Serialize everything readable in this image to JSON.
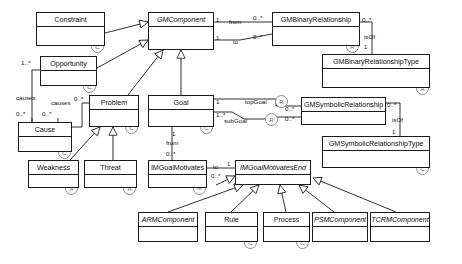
{
  "diagram": {
    "type": "uml-class-diagram",
    "stroke_color": "#1a1a1a",
    "stereotype_color": "#8e8e8e",
    "background": "#ffffff",
    "width": 462,
    "height": 264
  },
  "classes": [
    {
      "id": "constraint",
      "name": "Constraint",
      "abstract": false,
      "stereotype": "C",
      "x": 36,
      "y": 12,
      "w": 69,
      "h": 34
    },
    {
      "id": "gmcomponent",
      "name": "GMComponent",
      "abstract": true,
      "stereotype": "",
      "x": 148,
      "y": 12,
      "w": 66,
      "h": 38
    },
    {
      "id": "gmbinaryrelationship",
      "name": "GMBinaryRelationship",
      "abstract": false,
      "stereotype": "R",
      "x": 272,
      "y": 12,
      "w": 88,
      "h": 34
    },
    {
      "id": "gmbinaryrelationshiptype",
      "name": "GMBinaryRelationshipType",
      "abstract": false,
      "stereotype": "A",
      "x": 322,
      "y": 54,
      "w": 108,
      "h": 34
    },
    {
      "id": "opportunity",
      "name": "Opportunity",
      "abstract": false,
      "stereotype": "C",
      "x": 40,
      "y": 56,
      "w": 57,
      "h": 30
    },
    {
      "id": "problem",
      "name": "Problem",
      "abstract": false,
      "stereotype": "C",
      "x": 89,
      "y": 95,
      "w": 50,
      "h": 32
    },
    {
      "id": "goal",
      "name": "Goal",
      "abstract": false,
      "stereotype": "C",
      "x": 148,
      "y": 95,
      "w": 66,
      "h": 32
    },
    {
      "id": "gmsymbolicrelationship",
      "name": "GMSymbolicRelationship",
      "abstract": false,
      "stereotype": "",
      "x": 301,
      "y": 97,
      "w": 85,
      "h": 28
    },
    {
      "id": "gmsymbolicrelationshiptype",
      "name": "GMSymbolicRelationshipType",
      "abstract": false,
      "stereotype": "C",
      "x": 322,
      "y": 136,
      "w": 108,
      "h": 32
    },
    {
      "id": "cause",
      "name": "Cause",
      "abstract": false,
      "stereotype": "C",
      "x": 18,
      "y": 122,
      "w": 54,
      "h": 30
    },
    {
      "id": "weakness",
      "name": "Weakness",
      "abstract": false,
      "stereotype": "A",
      "x": 28,
      "y": 160,
      "w": 51,
      "h": 28
    },
    {
      "id": "threat",
      "name": "Threat",
      "abstract": false,
      "stereotype": "A",
      "x": 84,
      "y": 160,
      "w": 53,
      "h": 28
    },
    {
      "id": "imgoalmotivates",
      "name": "IMGoalMotivates",
      "abstract": false,
      "stereotype": "IR",
      "x": 148,
      "y": 160,
      "w": 59,
      "h": 28
    },
    {
      "id": "imgoalmotivatesend",
      "name": "IMGoalMotivatesEnd",
      "abstract": true,
      "stereotype": "",
      "x": 235,
      "y": 160,
      "w": 76,
      "h": 25
    },
    {
      "id": "armcomponent",
      "name": "ARMComponent",
      "abstract": true,
      "stereotype": "",
      "x": 138,
      "y": 212,
      "w": 60,
      "h": 30
    },
    {
      "id": "rule",
      "name": "Rule",
      "abstract": false,
      "stereotype": "C",
      "x": 205,
      "y": 212,
      "w": 53,
      "h": 30
    },
    {
      "id": "process",
      "name": "Process",
      "abstract": false,
      "stereotype": "C",
      "x": 263,
      "y": 212,
      "w": 47,
      "h": 30
    },
    {
      "id": "psmcomponent",
      "name": "PSMComponent",
      "abstract": true,
      "stereotype": "",
      "x": 312,
      "y": 212,
      "w": 56,
      "h": 30
    },
    {
      "id": "tcrmcomponent",
      "name": "TCRMComponent",
      "abstract": true,
      "stereotype": "",
      "x": 370,
      "y": 212,
      "w": 60,
      "h": 30
    }
  ],
  "labels": [
    {
      "id": "mult-gmc-from-1",
      "text": "1",
      "x": 216,
      "y": 17,
      "italic": false
    },
    {
      "id": "role-from",
      "text": "from",
      "x": 229,
      "y": 19,
      "italic": false
    },
    {
      "id": "mult-from-many",
      "text": "0..*",
      "x": 253,
      "y": 15,
      "italic": false
    },
    {
      "id": "mult-gmc-to-1",
      "text": "1",
      "x": 216,
      "y": 35,
      "italic": false
    },
    {
      "id": "role-to",
      "text": "to",
      "x": 233,
      "y": 39,
      "italic": false
    },
    {
      "id": "mult-to-many",
      "text": "0..*",
      "x": 253,
      "y": 34,
      "italic": false
    },
    {
      "id": "mult-gmbr-many",
      "text": "0..*",
      "x": 362,
      "y": 17,
      "italic": false
    },
    {
      "id": "role-isof-binary",
      "text": "isOf",
      "x": 364,
      "y": 34,
      "italic": false
    },
    {
      "id": "mult-isof-1",
      "text": "1",
      "x": 364,
      "y": 44,
      "italic": false
    },
    {
      "id": "mult-opp-many",
      "text": "1..*",
      "x": 21,
      "y": 60,
      "italic": false
    },
    {
      "id": "role-causes-1",
      "text": "causes",
      "x": 16,
      "y": 95,
      "italic": false
    },
    {
      "id": "role-causes-2",
      "text": "causes",
      "x": 51,
      "y": 100,
      "italic": false
    },
    {
      "id": "mult-prob-many",
      "text": "0..*",
      "x": 74,
      "y": 96,
      "italic": false
    },
    {
      "id": "mult-cause-l",
      "text": "0..*",
      "x": 16,
      "y": 111,
      "italic": false
    },
    {
      "id": "mult-cause-r",
      "text": "0..*",
      "x": 42,
      "y": 111,
      "italic": false
    },
    {
      "id": "mult-goal-1",
      "text": "1",
      "x": 216,
      "y": 99,
      "italic": false
    },
    {
      "id": "role-topgoal",
      "text": "topGoal",
      "x": 245,
      "y": 99,
      "italic": false
    },
    {
      "id": "mult-goal-many",
      "text": "1..*",
      "x": 216,
      "y": 112,
      "italic": false
    },
    {
      "id": "role-subgoal",
      "text": "subGoal",
      "x": 224,
      "y": 118,
      "italic": false
    },
    {
      "id": "mult-topgoal-many",
      "text": "0..*",
      "x": 285,
      "y": 106,
      "italic": false
    },
    {
      "id": "mult-subgoal-many",
      "text": "0..*",
      "x": 285,
      "y": 116,
      "italic": false
    },
    {
      "id": "mult-gmsr-many",
      "text": "0..*",
      "x": 387,
      "y": 102,
      "italic": false
    },
    {
      "id": "role-isof-sym",
      "text": "isOf",
      "x": 392,
      "y": 117,
      "italic": false
    },
    {
      "id": "mult-isof-sym-1",
      "text": "1",
      "x": 392,
      "y": 129,
      "italic": false
    },
    {
      "id": "mult-goal-from-1",
      "text": "1",
      "x": 172,
      "y": 131,
      "italic": false
    },
    {
      "id": "role-from-goal",
      "text": "from",
      "x": 166,
      "y": 140,
      "italic": false
    },
    {
      "id": "mult-imgm-many",
      "text": "0..*",
      "x": 166,
      "y": 151,
      "italic": false
    },
    {
      "id": "role-to-end",
      "text": "to",
      "x": 213,
      "y": 164,
      "italic": false
    },
    {
      "id": "mult-end-1",
      "text": "1",
      "x": 227,
      "y": 161,
      "italic": false
    },
    {
      "id": "mult-to-end-many",
      "text": "0..*",
      "x": 211,
      "y": 173,
      "italic": false
    }
  ],
  "relationships": [
    {
      "from": "constraint",
      "to": "gmcomponent",
      "kind": "generalization"
    },
    {
      "from": "opportunity",
      "to": "gmcomponent",
      "kind": "generalization"
    },
    {
      "from": "problem",
      "to": "gmcomponent",
      "kind": "generalization"
    },
    {
      "from": "goal",
      "to": "gmcomponent",
      "kind": "generalization"
    },
    {
      "from": "weakness",
      "to": "problem",
      "kind": "generalization"
    },
    {
      "from": "threat",
      "to": "problem",
      "kind": "generalization"
    },
    {
      "from": "gmcomponent",
      "to": "gmbinaryrelationship",
      "kind": "association",
      "roles": [
        "from",
        "to"
      ]
    },
    {
      "from": "gmbinaryrelationship",
      "to": "gmbinaryrelationshiptype",
      "kind": "association",
      "role": "isOf"
    },
    {
      "from": "goal",
      "to": "gmsymbolicrelationship",
      "kind": "association",
      "roles": [
        "topGoal",
        "subGoal"
      ]
    },
    {
      "from": "gmsymbolicrelationship",
      "to": "gmsymbolicrelationshiptype",
      "kind": "association",
      "role": "isOf"
    },
    {
      "from": "cause",
      "to": "problem",
      "kind": "association",
      "role": "causes"
    },
    {
      "from": "opportunity",
      "to": "cause",
      "kind": "association",
      "role": "causes"
    },
    {
      "from": "goal",
      "to": "imgoalmotivates",
      "kind": "association",
      "role": "from"
    },
    {
      "from": "imgoalmotivates",
      "to": "imgoalmotivatesend",
      "kind": "association",
      "role": "to"
    },
    {
      "from": "armcomponent",
      "to": "imgoalmotivatesend",
      "kind": "generalization"
    },
    {
      "from": "rule",
      "to": "imgoalmotivatesend",
      "kind": "generalization"
    },
    {
      "from": "process",
      "to": "imgoalmotivatesend",
      "kind": "generalization"
    },
    {
      "from": "psmcomponent",
      "to": "imgoalmotivatesend",
      "kind": "generalization"
    },
    {
      "from": "tcrmcomponent",
      "to": "imgoalmotivatesend",
      "kind": "generalization"
    }
  ]
}
